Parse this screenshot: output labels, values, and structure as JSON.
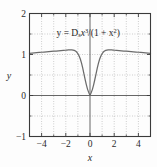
{
  "chart_data": {
    "type": "line",
    "title": "",
    "xlabel": "x",
    "ylabel": "y",
    "xlim": [
      -5,
      5
    ],
    "ylim": [
      -1,
      2
    ],
    "grid": true,
    "grid_style": "dotted",
    "x_ticks": [
      -4,
      -2,
      0,
      2,
      4
    ],
    "x_tick_labels": [
      "−4",
      "−2",
      "0",
      "2",
      "4"
    ],
    "x_minor_ticks": [
      -5,
      -3,
      -1,
      1,
      3,
      5
    ],
    "y_ticks": [
      -1,
      0,
      1,
      2
    ],
    "y_tick_labels": [
      "−1",
      "0",
      "1",
      "2"
    ],
    "y_minor_ticks": [
      -0.5,
      0.5,
      1.5
    ],
    "x_gridlines": [
      -3,
      -1,
      1,
      3
    ],
    "y_gridlines": [
      -0.5,
      0.5,
      1.5
    ],
    "zero_axis_x": 0,
    "zero_axis_y": 0,
    "annotation": {
      "text": "y = D_s x^3/(1 + x^2)",
      "parts": {
        "lead": "y = D",
        "sub": "s",
        "var1": "x",
        "sup1": "3",
        "mid": "/(1 + x",
        "sup2": "2",
        "tail": ")"
      },
      "x": 1.2,
      "y": 1.52
    },
    "series": [
      {
        "name": "y = D_s x^3/(1 + x^2)",
        "color": "#6b6b6b",
        "x": [
          -5.0,
          -4.8,
          -4.6,
          -4.4,
          -4.2,
          -4.0,
          -3.8,
          -3.6,
          -3.4,
          -3.2,
          -3.0,
          -2.8,
          -2.6,
          -2.4,
          -2.2,
          -2.0,
          -1.9,
          -1.8,
          -1.7,
          -1.6,
          -1.5,
          -1.4,
          -1.3,
          -1.2,
          -1.1,
          -1.0,
          -0.9,
          -0.8,
          -0.7,
          -0.6,
          -0.5,
          -0.4,
          -0.3,
          -0.2,
          -0.1,
          0.0,
          0.1,
          0.2,
          0.3,
          0.4,
          0.5,
          0.6,
          0.7,
          0.8,
          0.9,
          1.0,
          1.1,
          1.2,
          1.3,
          1.4,
          1.5,
          1.6,
          1.7,
          1.8,
          1.9,
          2.0,
          2.2,
          2.4,
          2.6,
          2.8,
          3.0,
          3.2,
          3.4,
          3.6,
          3.8,
          4.0,
          4.2,
          4.4,
          4.6,
          4.8,
          5.0
        ],
        "y": [
          1.03,
          1.035,
          1.04,
          1.045,
          1.05,
          1.055,
          1.06,
          1.065,
          1.07,
          1.075,
          1.08,
          1.085,
          1.09,
          1.095,
          1.1,
          1.105,
          1.108,
          1.11,
          1.112,
          1.113,
          1.112,
          1.108,
          1.1,
          1.085,
          1.06,
          1.02,
          0.965,
          0.89,
          0.79,
          0.67,
          0.53,
          0.39,
          0.26,
          0.15,
          0.07,
          0.0,
          0.07,
          0.15,
          0.26,
          0.39,
          0.53,
          0.67,
          0.79,
          0.89,
          0.965,
          1.02,
          1.06,
          1.085,
          1.1,
          1.108,
          1.112,
          1.113,
          1.112,
          1.11,
          1.108,
          1.105,
          1.1,
          1.095,
          1.09,
          1.085,
          1.08,
          1.075,
          1.07,
          1.065,
          1.06,
          1.055,
          1.05,
          1.045,
          1.04,
          1.035,
          1.03
        ]
      }
    ]
  },
  "colors": {
    "curve": "#6b6b6b",
    "frame": "#3a3a3a",
    "grid": "#9a9a9a",
    "text": "#2b2b2b",
    "background": "#fdfdfd"
  }
}
